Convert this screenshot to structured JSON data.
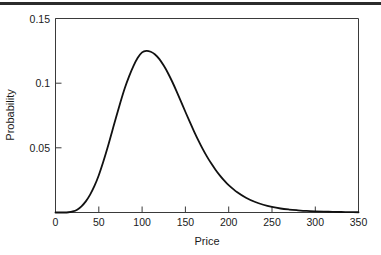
{
  "figure": {
    "title": "",
    "top_rule_color": "#2b2b2b",
    "background": "#ffffff"
  },
  "axis_titles": {
    "x": "Price",
    "y": "Probability"
  },
  "ticks": {
    "x_labels": [
      "0",
      "50",
      "100",
      "150",
      "200",
      "250",
      "300",
      "350"
    ],
    "y_labels": [
      "0.05",
      "0.1",
      "0.15"
    ]
  },
  "chart_data": {
    "type": "line",
    "title": "",
    "xlabel": "Price",
    "ylabel": "Probability",
    "xlim": [
      0,
      350
    ],
    "ylim": [
      0,
      0.15
    ],
    "xticks": [
      0,
      50,
      100,
      150,
      200,
      250,
      300,
      350
    ],
    "yticks": [
      0.05,
      0.1,
      0.15
    ],
    "grid": false,
    "legend": "none",
    "line_color": "#111111",
    "peak": {
      "x": 105,
      "y": 0.125
    },
    "series": [
      {
        "name": "Probability density",
        "x": [
          0,
          5,
          10,
          15,
          20,
          25,
          30,
          35,
          40,
          45,
          50,
          55,
          60,
          65,
          70,
          75,
          80,
          85,
          90,
          95,
          100,
          105,
          110,
          115,
          120,
          125,
          130,
          135,
          140,
          145,
          150,
          155,
          160,
          165,
          170,
          175,
          180,
          185,
          190,
          195,
          200,
          210,
          220,
          230,
          240,
          250,
          260,
          270,
          280,
          290,
          300,
          310,
          320,
          330,
          340,
          350
        ],
        "values": [
          0.0,
          0.0,
          0.0,
          0.0002,
          0.0008,
          0.0022,
          0.0048,
          0.0086,
          0.0138,
          0.0205,
          0.0288,
          0.0388,
          0.0498,
          0.0617,
          0.0737,
          0.0853,
          0.0961,
          0.1053,
          0.1132,
          0.1196,
          0.1238,
          0.125,
          0.1243,
          0.1222,
          0.1186,
          0.1136,
          0.1077,
          0.1009,
          0.0935,
          0.0857,
          0.0779,
          0.0702,
          0.0628,
          0.0558,
          0.0492,
          0.0432,
          0.0378,
          0.0329,
          0.0285,
          0.0246,
          0.0212,
          0.0156,
          0.0114,
          0.0083,
          0.006,
          0.0043,
          0.0031,
          0.0023,
          0.0017,
          0.0012,
          0.0009,
          0.0007,
          0.0005,
          0.0004,
          0.0003,
          0.0002
        ]
      }
    ]
  }
}
